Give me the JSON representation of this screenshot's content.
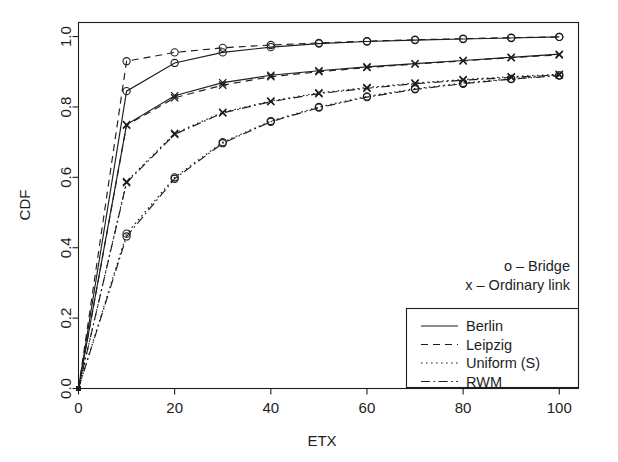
{
  "chart_data": {
    "type": "line",
    "title": "",
    "xlabel": "ETX",
    "ylabel": "CDF",
    "xlim": [
      0,
      104
    ],
    "ylim": [
      0,
      1.04
    ],
    "xticks": [
      0,
      20,
      40,
      60,
      80,
      100
    ],
    "xtick_labels": [
      "0",
      "20",
      "40",
      "60",
      "80",
      "100"
    ],
    "yticks": [
      0.0,
      0.2,
      0.4,
      0.6,
      0.8,
      1.0
    ],
    "ytick_labels": [
      "0.0",
      "0.2",
      "0.4",
      "0.6",
      "0.8",
      "1.0"
    ],
    "grid": false,
    "x": [
      0,
      10,
      20,
      30,
      40,
      50,
      60,
      70,
      80,
      90,
      100
    ],
    "series": [
      {
        "name": "Berlin - Bridge",
        "dataset": "Berlin",
        "node_type": "Bridge",
        "linestyle": "solid",
        "marker": "o",
        "values": [
          0.0,
          0.845,
          0.925,
          0.955,
          0.97,
          0.98,
          0.986,
          0.99,
          0.993,
          0.996,
          0.999
        ]
      },
      {
        "name": "Berlin - Ordinary link",
        "dataset": "Berlin",
        "node_type": "Ordinary link",
        "linestyle": "solid",
        "marker": "x",
        "values": [
          0.0,
          0.75,
          0.832,
          0.869,
          0.89,
          0.903,
          0.914,
          0.923,
          0.932,
          0.941,
          0.95
        ]
      },
      {
        "name": "Leipzig - Bridge",
        "dataset": "Leipzig",
        "node_type": "Bridge",
        "linestyle": "dashed",
        "marker": "o",
        "values": [
          0.0,
          0.93,
          0.955,
          0.968,
          0.976,
          0.982,
          0.987,
          0.991,
          0.994,
          0.997,
          0.999
        ]
      },
      {
        "name": "Leipzig - Ordinary link",
        "dataset": "Leipzig",
        "node_type": "Ordinary link",
        "linestyle": "dashed",
        "marker": "x",
        "values": [
          0.0,
          0.748,
          0.826,
          0.862,
          0.886,
          0.9,
          0.912,
          0.922,
          0.931,
          0.94,
          0.948
        ]
      },
      {
        "name": "Uniform (S) - Bridge",
        "dataset": "Uniform (S)",
        "node_type": "Bridge",
        "linestyle": "dotted",
        "marker": "o",
        "values": [
          0.0,
          0.44,
          0.6,
          0.7,
          0.76,
          0.8,
          0.83,
          0.852,
          0.868,
          0.88,
          0.89
        ]
      },
      {
        "name": "Uniform (S) - Ordinary link",
        "dataset": "Uniform (S)",
        "node_type": "Ordinary link",
        "linestyle": "dotted",
        "marker": "x",
        "values": [
          0.0,
          0.588,
          0.725,
          0.785,
          0.817,
          0.84,
          0.855,
          0.868,
          0.878,
          0.886,
          0.893
        ]
      },
      {
        "name": "RWM - Bridge",
        "dataset": "RWM",
        "node_type": "Bridge",
        "linestyle": "dashdot",
        "marker": "o",
        "values": [
          0.0,
          0.432,
          0.596,
          0.697,
          0.758,
          0.798,
          0.828,
          0.85,
          0.866,
          0.879,
          0.889
        ]
      },
      {
        "name": "RWM - Ordinary link",
        "dataset": "RWM",
        "node_type": "Ordinary link",
        "linestyle": "dashdot",
        "marker": "x",
        "values": [
          0.0,
          0.585,
          0.722,
          0.783,
          0.815,
          0.838,
          0.853,
          0.866,
          0.876,
          0.884,
          0.891
        ]
      }
    ],
    "marker_legend": [
      {
        "symbol": "o",
        "separator": "–",
        "label": "Bridge"
      },
      {
        "symbol": "x",
        "separator": "–",
        "label": "Ordinary link"
      }
    ],
    "line_legend": [
      {
        "linestyle": "solid",
        "label": "Berlin"
      },
      {
        "linestyle": "dashed",
        "label": "Leipzig"
      },
      {
        "linestyle": "dotted",
        "label": "Uniform (S)"
      },
      {
        "linestyle": "dashdot",
        "label": "RWM"
      }
    ],
    "colors": {
      "line": "#1d1d1d",
      "axis": "#1d1d1d",
      "background": "#ffffff"
    }
  }
}
